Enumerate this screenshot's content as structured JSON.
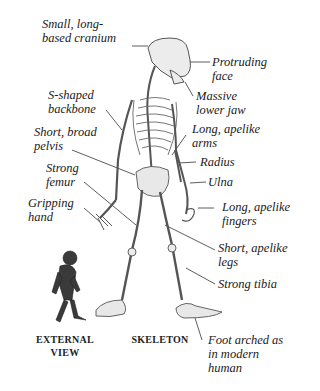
{
  "labels": {
    "cranium": "Small, long-\nbased cranium",
    "face": "Protruding\nface",
    "jaw": "Massive\nlower jaw",
    "backbone": "S-shaped\nbackbone",
    "arms": "Long, apelike\narms",
    "pelvis": "Short, broad\npelvis",
    "radius": "Radius",
    "ulna": "Ulna",
    "femur": "Strong\nfemur",
    "hand": "Gripping\nhand",
    "fingers": "Long, apelike\nfingers",
    "legs": "Short, apelike\nlegs",
    "tibia": "Strong tibia",
    "foot": "Foot arched as\nin modern\nhuman"
  },
  "captions": {
    "external": "EXTERNAL\nVIEW",
    "skeleton": "SKELETON"
  }
}
